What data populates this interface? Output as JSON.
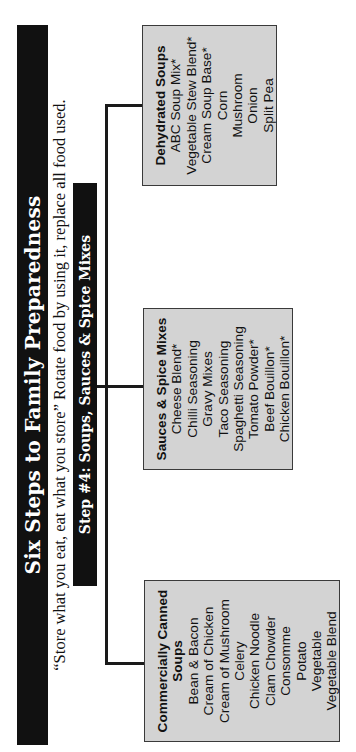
{
  "header": {
    "title": "Six Steps to Family Preparedness",
    "subtitle": "“Store what you eat, eat what you store” Rotate food by using it, replace all food used."
  },
  "step": {
    "label": "Step #4: Soups, Sauces & Spice Mixes"
  },
  "colors": {
    "bar_background": "#111111",
    "bar_text": "#ffffff",
    "box_fill": "#d3d3d3",
    "box_border": "#3a3a3a",
    "connector": "#1a1a1a"
  },
  "categories": [
    {
      "heading_line1": "Commercially Canned",
      "heading_line2": "Soups",
      "items": [
        "Bean & Bacon",
        "Cream of Chicken",
        "Cream of Mushroom",
        "Celery",
        "Chicken Noodle",
        "Clam Chowder",
        "Consomme",
        "Potato",
        "Vegetable",
        "Vegetable Blend"
      ]
    },
    {
      "heading_line1": "Sauces & Spice Mixes",
      "items": [
        "Cheese Blend*",
        "Chilli Seasoning",
        "Gravy Mixes",
        "Taco Seasoning",
        "Spaghetti Seasoning",
        "Tomato Powder*",
        "Beef Bouillon*",
        "Chicken Bouillon*"
      ]
    },
    {
      "heading_line1": "Dehydrated Soups",
      "items": [
        "ABC Soup Mix*",
        "Vegetable Stew Blend*",
        "Cream Soup Base*",
        "Corn",
        "Mushroom",
        "Onion",
        "Split Pea"
      ]
    }
  ]
}
